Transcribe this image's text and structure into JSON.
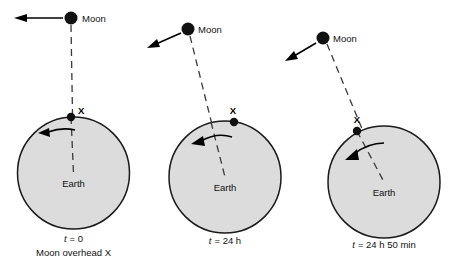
{
  "figure": {
    "background_color": "#ffffff",
    "earth_fill": "#dcdcdc",
    "earth_stroke": "#1a1a1a",
    "moon_fill": "#111111",
    "line_color": "#333333",
    "arrow_color": "#000000"
  },
  "panels": [
    {
      "id": "panel-1",
      "moon_label": "Moon",
      "earth_label": "Earth",
      "x_label": "X",
      "caption_time_symbol": "t",
      "caption_time": "= 0",
      "caption_line1": "t = 0",
      "caption_line2": "Moon overhead X",
      "moon_center": {
        "x": 71,
        "y": 18
      },
      "moon_radius": 6.5,
      "earth_center": {
        "x": 73.5,
        "y": 173
      },
      "earth_radius": 56,
      "x_point": {
        "x": 71,
        "y": 117
      },
      "moon_velocity_arrow": {
        "from_x": 63,
        "from_y": 18,
        "to_x": 20,
        "to_y": 18
      },
      "rotation_arrow_label": "earth-rotation-direction"
    },
    {
      "id": "panel-2",
      "moon_label": "Moon",
      "earth_label": "Earth",
      "x_label": "X",
      "caption_time_symbol": "t",
      "caption_time": "= 24 h",
      "caption_line1": "t = 24 h",
      "caption_line2": "",
      "moon_center": {
        "x": 188,
        "y": 29
      },
      "moon_radius": 6.5,
      "earth_center": {
        "x": 225,
        "y": 177
      },
      "earth_radius": 56,
      "x_point": {
        "x": 234,
        "y": 122
      },
      "moon_velocity_arrow": {
        "from_x": 181,
        "from_y": 33,
        "to_x": 152,
        "to_y": 46
      },
      "rotation_arrow_label": "earth-rotation-direction"
    },
    {
      "id": "panel-3",
      "moon_label": "Moon",
      "earth_label": "Earth",
      "x_label": "X",
      "caption_time_symbol": "t",
      "caption_time": "= 24 h 50 min",
      "caption_line1": "t = 24 h 50 min",
      "caption_line2": "",
      "moon_center": {
        "x": 323,
        "y": 38
      },
      "moon_radius": 6.5,
      "earth_center": {
        "x": 384,
        "y": 182
      },
      "earth_radius": 56,
      "x_point": {
        "x": 357,
        "y": 131
      },
      "moon_velocity_arrow": {
        "from_x": 316,
        "from_y": 43,
        "to_x": 290,
        "to_y": 58
      },
      "rotation_arrow_label": "earth-rotation-direction"
    }
  ]
}
